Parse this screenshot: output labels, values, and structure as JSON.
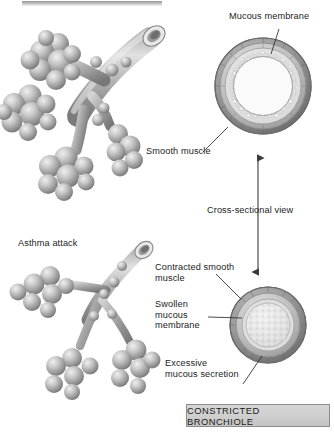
{
  "figure": {
    "title_bar": "",
    "caption": "CONSTRICTED BRONCHIOLE"
  },
  "labels": {
    "mucous_membrane": "Mucous membrane",
    "smooth_muscle": "Smooth muscle",
    "cross_sectional_view": "Cross-sectional view",
    "asthma_attack": "Asthma attack",
    "contracted_smooth_muscle": "Contracted smooth\nmuscle",
    "swollen_mucous_membrane": "Swollen\nmucous\nmembrane",
    "excessive_mucous_secretion": "Excessive\nmucous secretion"
  },
  "colors": {
    "background": "#ffffff",
    "ink": "#1c1c1c",
    "tissue_dark": "#6f6f6f",
    "tissue_mid": "#9a9a9a",
    "tissue_light": "#cfcfcf",
    "tissue_highlight": "#efefef",
    "caption_fill": "#cfcfcf",
    "caption_border": "#8d8d8d",
    "leader_line": "#2b2b2b"
  },
  "panels": [
    {
      "id": "normal-bronchiole-tree",
      "name": "Normal bronchiole with alveolar clusters",
      "position": "top-left"
    },
    {
      "id": "normal-bronchiole-cross-section",
      "name": "Normal bronchiole cross-section (open lumen)",
      "position": "top-right"
    },
    {
      "id": "asthma-bronchiole-tree",
      "name": "Constricted bronchiole with alveolar clusters",
      "position": "bottom-left"
    },
    {
      "id": "constricted-bronchiole-cross-section",
      "name": "Constricted bronchiole cross-section (occluded lumen)",
      "position": "bottom-right"
    }
  ]
}
